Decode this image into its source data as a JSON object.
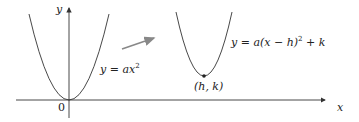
{
  "diagram": {
    "axis_labels": {
      "y": "y",
      "x": "x",
      "origin": "0"
    },
    "curve1": {
      "label": "y = ax²",
      "prefix": "y = a",
      "var": "x",
      "exp": "2"
    },
    "curve2": {
      "label": "y = a(x − h)² + k",
      "prefix": "y = a(x − h)",
      "exp": "2",
      "suffix": " + k"
    },
    "vertex_label": "(h, k)",
    "colors": {
      "curve": "#333333",
      "axis": "#333333",
      "arrow": "#777777"
    }
  }
}
